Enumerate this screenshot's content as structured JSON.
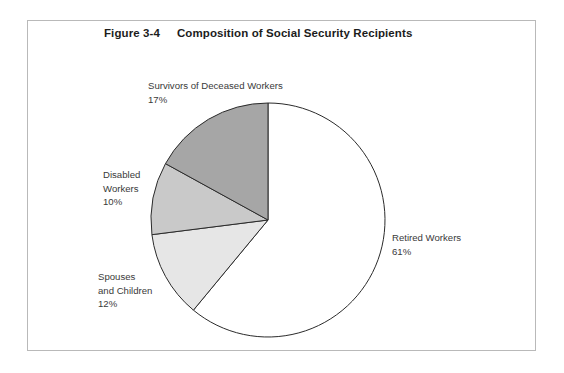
{
  "figure": {
    "number": "Figure 3-4",
    "title": "Composition of Social Security Recipients"
  },
  "labels": {
    "survivors": {
      "line1": "Survivors of Deceased Workers",
      "percent": "17%"
    },
    "disabled": {
      "line1": "Disabled",
      "line2": "Workers",
      "percent": "10%"
    },
    "spouses": {
      "line1": "Spouses",
      "line2": "and Children",
      "percent": "12%"
    },
    "retired": {
      "line1": "Retired Workers",
      "percent": "61%"
    }
  },
  "colors": {
    "retired_fill": "#ffffff",
    "spouses_fill": "#e6e6e6",
    "disabled_fill": "#c9c9c9",
    "survivors_fill": "#a6a6a6",
    "slice_stroke": "#2b2b2b",
    "frame_border": "#b9b9b9",
    "text": "#3a3a3a",
    "title_text": "#1c1c1c"
  },
  "chart_data": {
    "type": "pie",
    "title": "Composition of Social Security Recipients",
    "subtitle": "Figure 3-4",
    "xlabel": "",
    "ylabel": "",
    "units": "percent",
    "start_angle_deg": 0,
    "direction": "clockwise",
    "legend": "none",
    "grid": false,
    "categories": [
      "Retired Workers",
      "Spouses and Children",
      "Disabled Workers",
      "Survivors of Deceased Workers"
    ],
    "values": [
      61,
      12,
      10,
      17
    ],
    "slices": [
      {
        "label": "Retired Workers",
        "value": 61,
        "display": "61%",
        "color": "#ffffff",
        "start_deg": 0,
        "end_deg": 219.6
      },
      {
        "label": "Spouses and Children",
        "value": 12,
        "display": "12%",
        "color": "#e6e6e6",
        "start_deg": 219.6,
        "end_deg": 262.8
      },
      {
        "label": "Disabled Workers",
        "value": 10,
        "display": "10%",
        "color": "#c9c9c9",
        "start_deg": 262.8,
        "end_deg": 298.8
      },
      {
        "label": "Survivors of Deceased Workers",
        "value": 17,
        "display": "17%",
        "color": "#a6a6a6",
        "start_deg": 298.8,
        "end_deg": 360
      }
    ],
    "total": 100
  }
}
